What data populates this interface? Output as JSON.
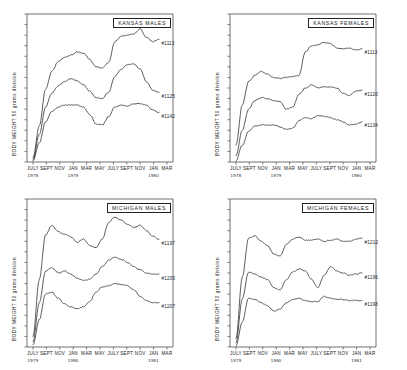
{
  "figure": {
    "background": "#ffffff",
    "line_color": "#262626",
    "text_color": "#1a1a1a",
    "axis_color": "#333333"
  },
  "chart_data": [
    {
      "type": "line",
      "title": "KANSAS MALES",
      "panel": "top-left",
      "xlabel": "",
      "ylabel": "BODY WEIGHT   50 grams division",
      "grid": false,
      "legend_position": "right-of-curve-end",
      "xtick_labels": [
        "JULY",
        "SEPT",
        "NOV",
        "JAN",
        "MAR",
        "MAY",
        "JULY",
        "SEPT",
        "NOV",
        "JAN",
        "MAR"
      ],
      "xyear_labels": [
        {
          "label": "1978",
          "at": "JULY"
        },
        {
          "label": "1979",
          "at": "JAN"
        },
        {
          "label": "1980",
          "at": "JAN"
        }
      ],
      "x": [
        0,
        1,
        2,
        3,
        4,
        5,
        6,
        7,
        8,
        9,
        10,
        11,
        12,
        13,
        14,
        15,
        16,
        17,
        18,
        19,
        20
      ],
      "ylim": [
        0,
        14
      ],
      "series": [
        {
          "name": "#1113",
          "values": [
            0.4,
            3.4,
            6.9,
            8.6,
            9.5,
            9.9,
            10.1,
            10.4,
            10.3,
            9.7,
            9.0,
            8.9,
            9.4,
            11.4,
            11.9,
            12.0,
            12.1,
            12.6,
            11.8,
            11.4,
            11.6
          ]
        },
        {
          "name": "#1125",
          "values": [
            0.2,
            2.6,
            5.2,
            6.5,
            7.2,
            7.6,
            7.9,
            7.7,
            7.3,
            6.7,
            6.1,
            6.0,
            6.6,
            8.1,
            8.8,
            9.2,
            9.3,
            8.8,
            7.6,
            6.8,
            6.6
          ]
        },
        {
          "name": "#1142",
          "values": [
            0.1,
            1.8,
            3.8,
            4.8,
            5.2,
            5.4,
            5.4,
            5.4,
            5.2,
            4.5,
            3.6,
            3.5,
            4.3,
            5.2,
            5.4,
            5.3,
            5.5,
            5.5,
            5.4,
            4.9,
            4.7
          ]
        }
      ]
    },
    {
      "type": "line",
      "title": "KANSAS FEMALES",
      "panel": "top-right",
      "xlabel": "",
      "ylabel": "BODY WEIGHT   50 grams division",
      "grid": false,
      "legend_position": "right-of-curve-end",
      "xtick_labels": [
        "JULY",
        "SEPT",
        "NOV",
        "JAN",
        "MAR",
        "MAY",
        "JULY",
        "SEPT",
        "NOV",
        "JAN",
        "MAR"
      ],
      "xyear_labels": [
        {
          "label": "1978",
          "at": "JULY"
        },
        {
          "label": "1979",
          "at": "JAN"
        },
        {
          "label": "1980",
          "at": "JAN"
        }
      ],
      "x": [
        0,
        1,
        2,
        3,
        4,
        5,
        6,
        7,
        8,
        9,
        10,
        11,
        12,
        13,
        14,
        15,
        16,
        17,
        18,
        19,
        20
      ],
      "ylim": [
        0,
        14
      ],
      "series": [
        {
          "name": "#1113",
          "values": [
            1.6,
            5.4,
            7.6,
            8.2,
            8.6,
            8.3,
            8.0,
            7.9,
            8.0,
            8.1,
            8.2,
            10.4,
            11.0,
            11.1,
            11.3,
            11.2,
            10.8,
            10.7,
            10.8,
            10.6,
            10.7
          ]
        },
        {
          "name": "#1120",
          "values": [
            0.6,
            3.0,
            5.0,
            5.8,
            6.1,
            6.0,
            5.8,
            5.7,
            5.0,
            5.2,
            6.4,
            7.0,
            7.3,
            7.0,
            7.1,
            7.1,
            7.0,
            6.5,
            6.3,
            6.7,
            6.8
          ]
        },
        {
          "name": "#1134",
          "values": [
            0.1,
            1.6,
            2.9,
            3.4,
            3.5,
            3.5,
            3.5,
            3.3,
            3.1,
            3.2,
            3.9,
            4.2,
            4.1,
            4.4,
            4.3,
            4.2,
            4.0,
            3.8,
            3.5,
            3.6,
            3.8
          ]
        }
      ]
    },
    {
      "type": "line",
      "title": "MICHIGAN MALES",
      "panel": "bottom-left",
      "xlabel": "",
      "ylabel": "BODY WEIGHT   50 grams division",
      "grid": false,
      "legend_position": "right-of-curve-end",
      "xtick_labels": [
        "JULY",
        "SEPT",
        "NOV",
        "JAN",
        "MAR",
        "MAY",
        "JULY",
        "SEPT",
        "NOV",
        "JAN",
        "MAR"
      ],
      "xyear_labels": [
        {
          "label": "1979",
          "at": "JULY"
        },
        {
          "label": "1980",
          "at": "JAN"
        },
        {
          "label": "1981",
          "at": "JAN"
        }
      ],
      "x": [
        0,
        1,
        2,
        3,
        4,
        5,
        6,
        7,
        8,
        9,
        10,
        11,
        12,
        13,
        14,
        15,
        16,
        17,
        18,
        19,
        20
      ],
      "ylim": [
        0,
        14
      ],
      "series": [
        {
          "name": "#1197",
          "values": [
            1.0,
            6.4,
            10.6,
            11.5,
            10.9,
            10.7,
            10.4,
            9.9,
            10.2,
            9.6,
            9.4,
            10.2,
            11.8,
            12.3,
            12.0,
            11.6,
            11.3,
            11.5,
            11.0,
            10.5,
            10.2
          ]
        },
        {
          "name": "#1205",
          "values": [
            0.5,
            4.2,
            7.2,
            7.5,
            7.0,
            7.2,
            6.9,
            6.5,
            6.3,
            6.4,
            6.9,
            7.6,
            8.2,
            8.5,
            8.3,
            8.0,
            7.6,
            7.3,
            7.0,
            6.9,
            6.9
          ]
        },
        {
          "name": "#1207",
          "values": [
            0.2,
            2.6,
            5.0,
            5.2,
            4.6,
            4.1,
            3.8,
            3.6,
            3.8,
            4.3,
            5.2,
            5.7,
            5.8,
            6.0,
            5.9,
            5.8,
            5.4,
            4.8,
            4.4,
            4.2,
            4.2
          ]
        }
      ]
    },
    {
      "type": "line",
      "title": "MICHIGAN FEMALES",
      "panel": "bottom-right",
      "xlabel": "",
      "ylabel": "BODY WEIGHT   50 grams division",
      "grid": false,
      "legend_position": "right-of-curve-end",
      "xtick_labels": [
        "JULY",
        "SEPT",
        "NOV",
        "JAN",
        "MAR",
        "MAY",
        "JULY",
        "SEPT",
        "NOV",
        "JAN",
        "MAR"
      ],
      "xyear_labels": [
        {
          "label": "1979",
          "at": "JULY"
        },
        {
          "label": "1980",
          "at": "JAN"
        },
        {
          "label": "1981",
          "at": "JAN"
        }
      ],
      "x": [
        0,
        1,
        2,
        3,
        4,
        5,
        6,
        7,
        8,
        9,
        10,
        11,
        12,
        13,
        14,
        15,
        16,
        17,
        18,
        19,
        20
      ],
      "ylim": [
        0,
        14
      ],
      "series": [
        {
          "name": "#1212",
          "values": [
            0.8,
            6.6,
            10.3,
            10.5,
            10.0,
            9.6,
            8.8,
            8.6,
            9.7,
            10.2,
            10.4,
            10.1,
            10.1,
            10.2,
            10.0,
            10.1,
            10.2,
            10.0,
            10.0,
            10.2,
            10.3
          ]
        },
        {
          "name": "#1196",
          "values": [
            0.4,
            4.6,
            7.1,
            6.9,
            6.6,
            6.4,
            5.6,
            5.4,
            6.4,
            7.1,
            7.4,
            7.2,
            6.4,
            5.6,
            6.8,
            7.6,
            7.2,
            7.0,
            6.8,
            6.9,
            7.0
          ]
        },
        {
          "name": "#1198",
          "values": [
            0.1,
            2.4,
            4.6,
            4.5,
            4.2,
            3.9,
            3.4,
            3.6,
            4.2,
            4.5,
            4.6,
            4.4,
            4.3,
            4.3,
            4.8,
            4.6,
            4.5,
            4.5,
            4.4,
            4.4,
            4.4
          ]
        }
      ]
    }
  ]
}
